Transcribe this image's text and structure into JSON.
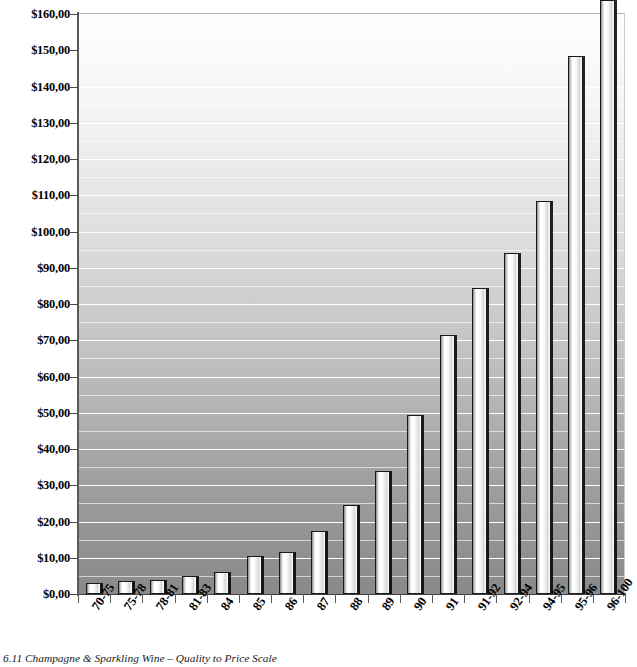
{
  "caption": "6.11  Champagne & Sparkling Wine – Quality to Price Scale",
  "axis": {
    "y_tick_labels": [
      "$0,00",
      "$10,00",
      "$20,00",
      "$30,00",
      "$40,00",
      "$50,00",
      "$60,00",
      "$70,00",
      "$80,00",
      "$90,00",
      "$100,00",
      "$110,00",
      "$120,00",
      "$130,00",
      "$140,00",
      "$150,00",
      "$160,00"
    ]
  },
  "chart_data": {
    "type": "bar",
    "title": "6.11  Champagne & Sparkling Wine – Quality to Price Scale",
    "xlabel": "",
    "ylabel": "",
    "categories": [
      "70-75",
      "75-78",
      "78-81",
      "81-83",
      "84",
      "85",
      "86",
      "87",
      "88",
      "89",
      "90",
      "91",
      "91-92",
      "92-94",
      "94-95",
      "95-96",
      "96-100"
    ],
    "values": [
      3.0,
      3.5,
      4.0,
      5.0,
      6.0,
      10.5,
      11.5,
      17.5,
      24.5,
      34.0,
      49.5,
      71.5,
      84.5,
      94.0,
      108.5,
      148.5,
      170.0
    ],
    "value_labels": [
      "$3,00",
      "$3,50",
      "$4,00",
      "$5,00",
      "$6,00",
      "$10,50",
      "$11,50",
      "$17,50",
      "$24,50",
      "$34,00",
      "$49,50",
      "$71,50",
      "$84,50",
      "$94,00",
      "$108,50",
      "$148,50",
      "$170,00"
    ],
    "ylim": [
      0,
      160
    ],
    "y_major_step": 10,
    "y_minor_step": 5,
    "grid": true,
    "legend": "none",
    "colors": {
      "bar_fill": "#ffffff",
      "bar_outline": "#1a1a1a",
      "plot_background_top": "#fdfdfd",
      "plot_background_bottom": "#8a8a8a",
      "gridline": "#ffffff",
      "axis": "#3c3c3c"
    }
  }
}
